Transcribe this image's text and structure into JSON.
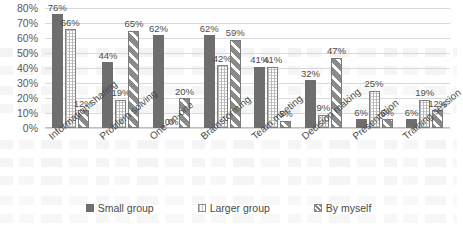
{
  "chart_data": {
    "type": "bar",
    "title": "",
    "xlabel": "",
    "ylabel": "",
    "ylim": [
      0,
      80
    ],
    "yticks": [
      "0%",
      "10%",
      "20%",
      "30%",
      "40%",
      "50%",
      "60%",
      "70%",
      "80%"
    ],
    "grid": true,
    "legend_position": "bottom-center",
    "value_labels": true,
    "value_label_suffix": "%",
    "categories": [
      "Information sharing",
      "Problem solving",
      "One-on-one",
      "Brainstorming",
      "Team meeting",
      "Decision making",
      "Presentation",
      "Training session"
    ],
    "series": [
      {
        "name": "Small group",
        "color": "#6e6e6e",
        "pattern": "solid",
        "values": [
          76,
          44,
          62,
          62,
          41,
          32,
          6,
          6
        ],
        "labels": [
          "76%",
          "44%",
          "62%",
          "62%",
          "41%",
          "32%",
          "6%",
          "6%"
        ]
      },
      {
        "name": "Larger group",
        "color": "#ffffff",
        "pattern": "dotted",
        "values": [
          66,
          19,
          0,
          42,
          41,
          9,
          25,
          19
        ],
        "labels": [
          "66%",
          "19%",
          "0%",
          "42%",
          "41%",
          "9%",
          "25%",
          "19%"
        ]
      },
      {
        "name": "By myself",
        "color": "#ffffff",
        "pattern": "diagonal-stripes",
        "values": [
          12,
          65,
          20,
          59,
          5,
          47,
          6,
          12
        ],
        "labels": [
          "12%",
          "65%",
          "20%",
          "59%",
          "5%",
          "47%",
          "6%",
          "12%"
        ]
      }
    ]
  }
}
